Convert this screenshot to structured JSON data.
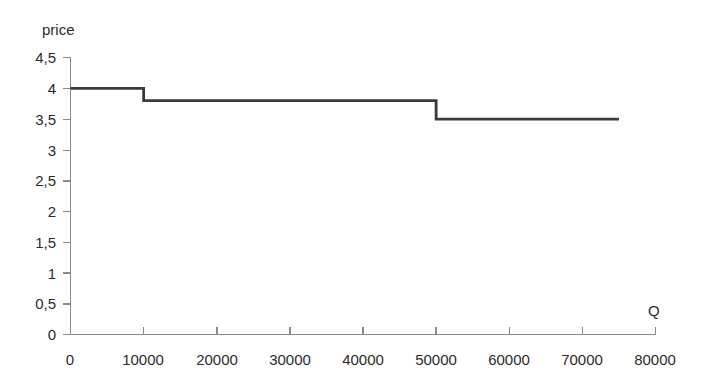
{
  "chart_data": {
    "type": "line",
    "title": "",
    "subtitle": "",
    "xlabel": "Q",
    "ylabel": "price",
    "xlim": [
      0,
      80000
    ],
    "ylim": [
      0,
      4.5
    ],
    "grid": false,
    "legend": null,
    "line_style": "step-after",
    "x_tick_labels": [
      "0",
      "10000",
      "20000",
      "30000",
      "40000",
      "50000",
      "60000",
      "70000",
      "80000"
    ],
    "x_ticks": [
      0,
      10000,
      20000,
      30000,
      40000,
      50000,
      60000,
      70000,
      80000
    ],
    "y_tick_labels": [
      "0",
      "0,5",
      "1",
      "1,5",
      "2",
      "2,5",
      "3",
      "3,5",
      "4",
      "4,5"
    ],
    "y_ticks": [
      0,
      0.5,
      1,
      1.5,
      2,
      2.5,
      3,
      3.5,
      4,
      4.5
    ],
    "decimal_separator": ",",
    "series": [
      {
        "name": "price",
        "color": "#3a3a3a",
        "steps": [
          {
            "x_start": 0,
            "x_end": 10000,
            "y": 4.0
          },
          {
            "x_start": 10000,
            "x_end": 50000,
            "y": 3.8
          },
          {
            "x_start": 50000,
            "x_end": 75000,
            "y": 3.5
          }
        ],
        "x": [
          0,
          10000,
          10000,
          50000,
          50000,
          75000
        ],
        "values": [
          4.0,
          4.0,
          3.8,
          3.8,
          3.5,
          3.5
        ]
      }
    ],
    "annotations": []
  },
  "labels": {
    "y_axis_title": "price",
    "x_axis_title": "Q",
    "y0": "0",
    "y1": "0,5",
    "y2": "1",
    "y3": "1,5",
    "y4": "2",
    "y5": "2,5",
    "y6": "3",
    "y7": "3,5",
    "y8": "4",
    "y9": "4,5",
    "x0": "0",
    "x1": "10000",
    "x2": "20000",
    "x3": "30000",
    "x4": "40000",
    "x5": "50000",
    "x6": "60000",
    "x7": "70000",
    "x8": "80000"
  },
  "colors": {
    "series": "#3a3a3a",
    "axis": "#8a8a8a",
    "text": "#2b2b2b",
    "background": "#ffffff"
  }
}
